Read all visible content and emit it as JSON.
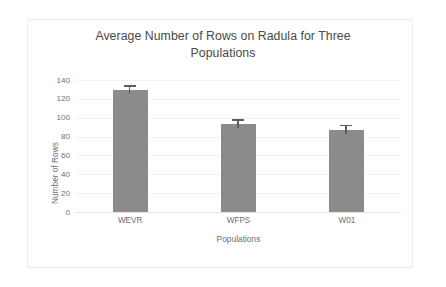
{
  "chart_data": {
    "type": "bar",
    "title": "Average Number of Rows on Radula for Three Populations",
    "title_line1": "Average Number of Rows on Radula for Three",
    "title_line2": "Populations",
    "xlabel": "Populations",
    "ylabel": "Number of Rows",
    "categories": [
      "WEVR",
      "WFPS",
      "W01"
    ],
    "values": [
      129,
      93,
      87
    ],
    "errors": [
      4,
      4,
      4
    ],
    "series": [
      {
        "name": "Average Number of Rows",
        "values": [
          129,
          93,
          87
        ],
        "errors": [
          4,
          4,
          4
        ]
      }
    ],
    "ylim": [
      0,
      140
    ],
    "yticks": [
      0,
      20,
      40,
      60,
      80,
      100,
      120,
      140
    ],
    "ytick_labels": [
      "0",
      "20",
      "40",
      "60",
      "80",
      "100",
      "120",
      "140"
    ],
    "grid": true,
    "grid_axis": "y",
    "legend": false,
    "legend_position": "none",
    "bar_color": "#8b8b8b",
    "error_bar_color": "#5d5d5d",
    "gridline_color": "#f1f1f1",
    "axis_color": "#e3e3e3",
    "text_color": "#6f6f6f",
    "title_color": "#4a4a4a",
    "background_color": "#ffffff",
    "frame_color": "#ececec"
  }
}
